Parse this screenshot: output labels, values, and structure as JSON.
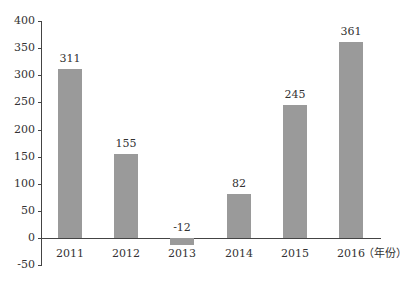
{
  "chart_data": {
    "type": "bar",
    "title": "",
    "xlabel": "（年份）",
    "ylabel": "",
    "categories": [
      "2011",
      "2012",
      "2013",
      "2014",
      "2015",
      "2016"
    ],
    "values": [
      311,
      155,
      -12,
      82,
      245,
      361
    ],
    "data_labels": [
      "311",
      "155",
      "-12",
      "82",
      "245",
      "361"
    ],
    "ylim": [
      -50,
      400
    ],
    "yticks": [
      400,
      350,
      300,
      250,
      200,
      150,
      100,
      50,
      0,
      -50
    ],
    "grid": false,
    "legend": null,
    "bar_color": "#9a9a9a"
  }
}
